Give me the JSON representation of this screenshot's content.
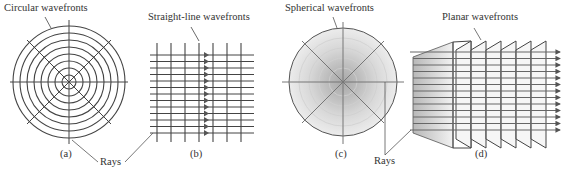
{
  "figure": {
    "panels": [
      {
        "id": "a",
        "caption": "(a)",
        "label": "Circular wavefronts",
        "type": "circular"
      },
      {
        "id": "b",
        "caption": "(b)",
        "label": "Straight-line wavefronts",
        "type": "straight-line"
      },
      {
        "id": "c",
        "caption": "(c)",
        "label": "Spherical wavefronts",
        "type": "spherical"
      },
      {
        "id": "d",
        "caption": "(d)",
        "label": "Planar wavefronts",
        "type": "planar"
      }
    ],
    "rays_labels": [
      "Rays",
      "Rays"
    ]
  },
  "colors": {
    "line": "#4a4a4a",
    "sphere_fill": "#e6e6e6",
    "plane_fill": "#dcdcdc"
  }
}
